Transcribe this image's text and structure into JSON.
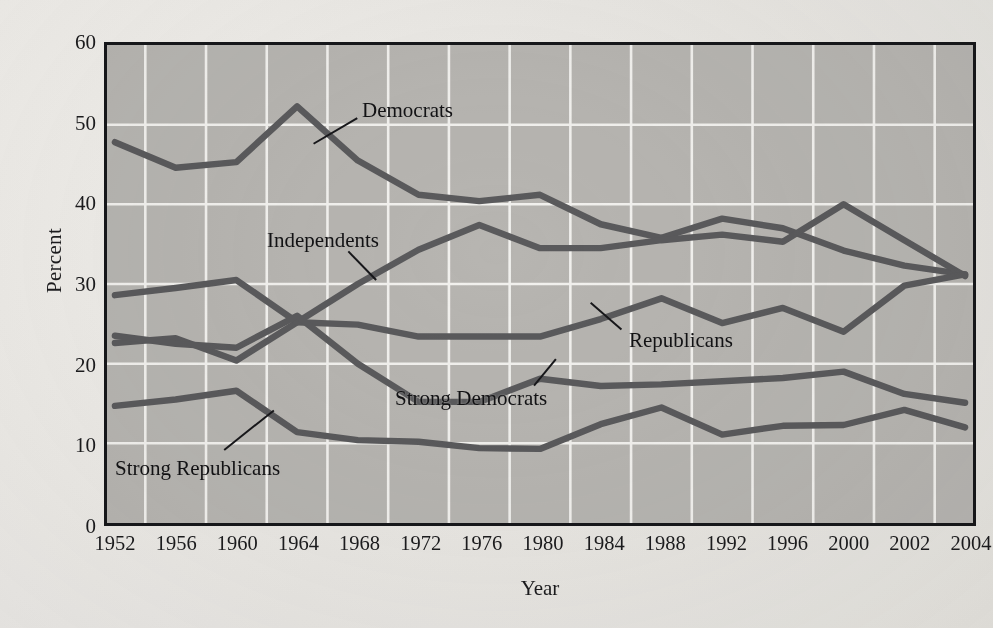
{
  "figure": {
    "background_color": "#eceae6",
    "plot_background_color": "#b7b5b1",
    "grid_color": "#f2f1ee",
    "line_color": "#5a5a5c",
    "frame_color": "#16171a"
  },
  "axes": {
    "y_title": "Percent",
    "x_title": "Year",
    "y_ticks": [
      "0",
      "10",
      "20",
      "30",
      "40",
      "50",
      "60"
    ],
    "x_ticks": [
      "1952",
      "1956",
      "1960",
      "1964",
      "1968",
      "1972",
      "1976",
      "1980",
      "1984",
      "1988",
      "1992",
      "1996",
      "2000",
      "2002",
      "2004"
    ]
  },
  "annotations": {
    "democrats": "Democrats",
    "independents": "Independents",
    "republicans": "Republicans",
    "strong_democrats": "Strong Democrats",
    "strong_republicans": "Strong Republicans"
  },
  "chart_data": {
    "type": "line",
    "title": "",
    "xlabel": "Year",
    "ylabel": "Percent",
    "xlim": [
      1952,
      2004
    ],
    "ylim": [
      0,
      60
    ],
    "grid": true,
    "legend_position": "inline-annotations",
    "x": [
      1952,
      1956,
      1960,
      1964,
      1968,
      1972,
      1976,
      1980,
      1984,
      1988,
      1992,
      1996,
      2000,
      2002,
      2004
    ],
    "categories": [
      "1952",
      "1956",
      "1960",
      "1964",
      "1968",
      "1972",
      "1976",
      "1980",
      "1984",
      "1988",
      "1992",
      "1996",
      "2000",
      "2002",
      "2004"
    ],
    "series": [
      {
        "name": "Democrats",
        "color": "#5a5a5c",
        "values": [
          47.8,
          44.6,
          45.3,
          52.3,
          45.5,
          41.2,
          40.4,
          41.2,
          37.5,
          35.8,
          38.2,
          37.0,
          34.2,
          32.3,
          31.2
        ]
      },
      {
        "name": "Independents",
        "color": "#5a5a5c",
        "values": [
          22.6,
          23.2,
          20.4,
          25.2,
          30.0,
          34.3,
          37.4,
          34.5,
          34.5,
          35.5,
          36.2,
          35.3,
          40.0,
          35.5,
          31.0
        ]
      },
      {
        "name": "Republicans",
        "color": "#5a5a5c",
        "values": [
          28.6,
          29.5,
          30.5,
          25.2,
          24.9,
          23.4,
          23.4,
          23.4,
          25.6,
          28.2,
          25.1,
          27.0,
          24.0,
          29.8,
          31.2
        ]
      },
      {
        "name": "Strong Democrats",
        "color": "#5a5a5c",
        "values": [
          23.5,
          22.5,
          22.0,
          26.0,
          20.0,
          15.2,
          15.2,
          18.1,
          17.2,
          17.4,
          17.8,
          18.2,
          19.0,
          16.2,
          15.1
        ]
      },
      {
        "name": "Strong Republicans",
        "color": "#5a5a5c",
        "values": [
          14.7,
          15.5,
          16.6,
          11.4,
          10.4,
          10.2,
          9.4,
          9.3,
          12.4,
          14.5,
          11.1,
          12.2,
          12.3,
          14.2,
          12.0
        ]
      }
    ]
  }
}
